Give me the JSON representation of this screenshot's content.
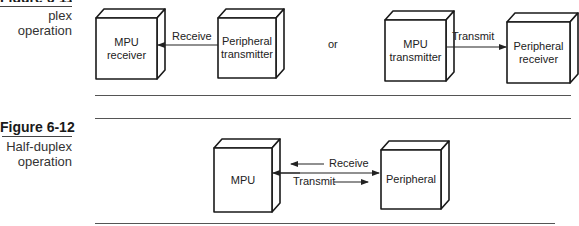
{
  "figure_6_11": {
    "title_partial": "Figure 6-11",
    "caption_partial": "plex operation",
    "left_group": {
      "mpu_box": "MPU\nreceiver",
      "mpu_line1": "MPU",
      "mpu_line2": "receiver",
      "peripheral_line1": "Peripheral",
      "peripheral_line2": "transmitter",
      "arrow_label": "Receive"
    },
    "separator": "or",
    "right_group": {
      "mpu_line1": "MPU",
      "mpu_line2": "transmitter",
      "peripheral_line1": "Peripheral",
      "peripheral_line2": "receiver",
      "arrow_label": "Transmit"
    }
  },
  "figure_6_12": {
    "title": "Figure 6-12",
    "caption_line1": "Half-duplex",
    "caption_line2": "operation",
    "mpu_label": "MPU",
    "peripheral_label": "Peripheral",
    "receive_label": "Receive",
    "transmit_label": "Transmit"
  }
}
